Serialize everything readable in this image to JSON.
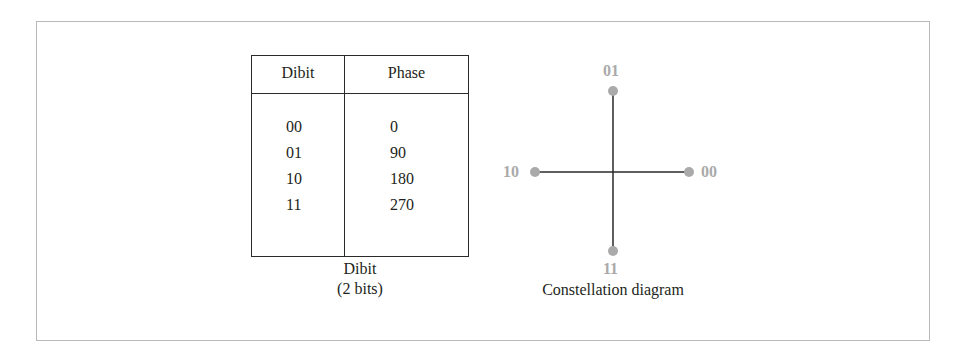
{
  "table": {
    "headers": [
      "Dibit",
      "Phase"
    ],
    "rows": [
      {
        "dibit": "00",
        "phase": "0"
      },
      {
        "dibit": "01",
        "phase": "90"
      },
      {
        "dibit": "10",
        "phase": "180"
      },
      {
        "dibit": "11",
        "phase": "270"
      }
    ],
    "caption_line1": "Dibit",
    "caption_line2": "(2 bits)"
  },
  "constellation": {
    "points": [
      {
        "label": "01",
        "position": "top",
        "phase": 90
      },
      {
        "label": "10",
        "position": "left",
        "phase": 180
      },
      {
        "label": "00",
        "position": "right",
        "phase": 0
      },
      {
        "label": "11",
        "position": "bottom",
        "phase": 270
      }
    ],
    "caption": "Constellation diagram",
    "point_color": "#aaaaaa",
    "axis_color": "#2a2a2a"
  }
}
